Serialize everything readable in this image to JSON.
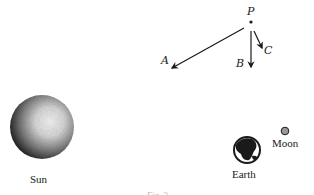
{
  "figure": {
    "point_label": "P",
    "vectors": [
      {
        "label": "A",
        "direction": "toward-lower-left"
      },
      {
        "label": "B",
        "direction": "down"
      },
      {
        "label": "C",
        "direction": "down-right"
      }
    ],
    "bodies": [
      {
        "label": "Sun"
      },
      {
        "label": "Earth"
      },
      {
        "label": "Moon"
      }
    ],
    "caption": "Fig. 3"
  },
  "colors": {
    "ink": "#1a1a1a",
    "background": "#ffffff"
  }
}
